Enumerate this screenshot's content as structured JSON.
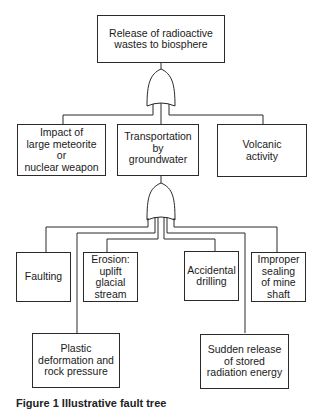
{
  "diagram": {
    "type": "fault-tree",
    "top_event": {
      "label": "Release of radioactive wastes to biosphere"
    },
    "gate_1": {
      "type": "OR",
      "inputs": [
        "impact",
        "groundwater",
        "volcanic"
      ]
    },
    "level_2": [
      {
        "id": "impact",
        "label": "Impact of large meteorite or nuclear weapon"
      },
      {
        "id": "groundwater",
        "label": "Transportation by groundwater"
      },
      {
        "id": "volcanic",
        "label": "Volcanic activity"
      }
    ],
    "gate_2": {
      "type": "OR",
      "parent": "groundwater",
      "inputs": [
        "faulting",
        "plastic",
        "erosion",
        "accidental",
        "sudden",
        "improper"
      ]
    },
    "level_3": [
      {
        "id": "faulting",
        "label": "Faulting"
      },
      {
        "id": "erosion",
        "label": "Erosion: uplift glacial stream"
      },
      {
        "id": "accidental",
        "label": "Accidental drilling"
      },
      {
        "id": "improper",
        "label": "Improper sealing of mine shaft"
      },
      {
        "id": "plastic",
        "label": "Plastic deformation and rock pressure"
      },
      {
        "id": "sudden",
        "label": "Sudden release of stored radiation energy"
      }
    ]
  },
  "labels": {
    "top": [
      "Release of radioactive",
      "wastes to biosphere"
    ],
    "impact": [
      "Impact of",
      "large meteorite",
      "or",
      "nuclear weapon"
    ],
    "groundwater": [
      "Transportation",
      "by",
      "groundwater"
    ],
    "volcanic": [
      "Volcanic",
      "activity"
    ],
    "faulting": [
      "Faulting"
    ],
    "erosion": [
      "Erosion:",
      "uplift",
      "glacial",
      "stream"
    ],
    "accidental": [
      "Accidental",
      "drilling"
    ],
    "improper": [
      "Improper",
      "sealing",
      "of mine",
      "shaft"
    ],
    "plastic": [
      "Plastic",
      "deformation and",
      "rock pressure"
    ],
    "sudden": [
      "Sudden release",
      "of stored",
      "radiation energy"
    ]
  },
  "caption": {
    "text": "Figure 1  Illustrative fault tree"
  }
}
